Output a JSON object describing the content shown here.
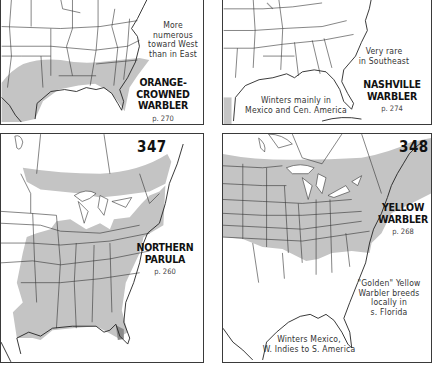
{
  "colors": {
    "range_fill": "#c4c4c4",
    "range_dark": "#8a8a8a",
    "border": "#3a3a3a",
    "lines": "#333333",
    "background": "#ffffff"
  },
  "maps": [
    {
      "id": "orange-crowned",
      "plate": "",
      "species": [
        "ORANGE-CROWNED",
        "WARBLER"
      ],
      "page": "p. 270",
      "notes": [
        "More",
        "numerous",
        "toward West",
        "than in East"
      ]
    },
    {
      "id": "nashville",
      "plate": "",
      "species": [
        "NASHVILLE",
        "WARBLER"
      ],
      "page": "p. 274",
      "notes": [
        "Very rare",
        "in Southeast"
      ],
      "winter_note": [
        "Winters mainly in",
        "Mexico and Cen. America"
      ]
    },
    {
      "id": "northern-parula",
      "plate": "347",
      "species": [
        "NORTHERN",
        "PARULA"
      ],
      "page": "p. 260"
    },
    {
      "id": "yellow",
      "plate": "348",
      "species": [
        "YELLOW",
        "WARBLER"
      ],
      "page": "p. 268",
      "notes": [
        "\"Golden\" Yellow",
        "Warbler breeds",
        "locally in",
        "s. Florida"
      ],
      "winter_note": [
        "Winters Mexico,",
        "W. Indies to S. America"
      ]
    }
  ]
}
